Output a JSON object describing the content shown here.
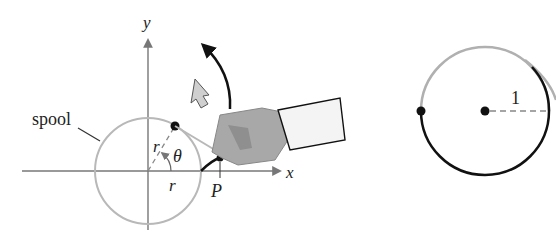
{
  "left_figure": {
    "axis_x_label": "x",
    "axis_y_label": "y",
    "spool_label": "spool",
    "radius_label_horizontal": "r",
    "radius_label_slanted": "r",
    "angle_label": "θ",
    "point_label": "P",
    "colors": {
      "spool": "#b8b8b8",
      "axis": "#777777",
      "string": "#111111",
      "hand": "#a8a8a8",
      "arrow_fill": "#cfcfcf"
    }
  },
  "right_figure": {
    "radius_label": "1",
    "colors": {
      "unwound_arc": "#b0b0b0",
      "wound_arc": "#111111"
    }
  }
}
